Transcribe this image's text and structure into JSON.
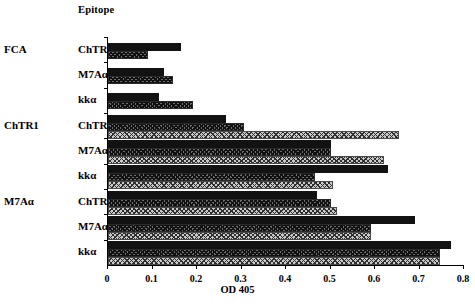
{
  "header": {
    "epitope_column_title": "Epitope"
  },
  "axis": {
    "x_title": "OD 405",
    "x_ticks": [
      "0",
      "0.1",
      "0.2",
      "0.3",
      "0.4",
      "0.5",
      "0.6",
      "0.7",
      "0.8"
    ]
  },
  "groups": [
    {
      "immunogen": "FCA",
      "rows": [
        {
          "epitope": "ChTR1",
          "values": [
            0.165,
            0.09
          ]
        },
        {
          "epitope": "M7Aα",
          "values": [
            0.125,
            0.145
          ]
        },
        {
          "epitope": "kkα",
          "values": [
            0.115,
            0.19
          ]
        }
      ]
    },
    {
      "immunogen": "ChTR1",
      "rows": [
        {
          "epitope": "ChTR1",
          "values": [
            0.265,
            0.305,
            0.655
          ]
        },
        {
          "epitope": "M7Aα",
          "values": [
            0.5,
            0.5,
            0.62
          ]
        },
        {
          "epitope": "kkα",
          "values": [
            0.63,
            0.465,
            0.505
          ]
        }
      ]
    },
    {
      "immunogen": "M7Aα",
      "rows": [
        {
          "epitope": "ChTR1",
          "values": [
            0.47,
            0.5,
            0.515
          ]
        },
        {
          "epitope": "M7Aα",
          "values": [
            0.69,
            0.59,
            0.59
          ]
        },
        {
          "epitope": "kkα",
          "values": [
            0.77,
            0.745,
            0.745
          ]
        }
      ]
    }
  ],
  "chart_data": {
    "type": "bar",
    "orientation": "horizontal",
    "title": "",
    "xlabel": "OD 405",
    "ylabel": "Epitope",
    "xlim": [
      0,
      0.8
    ],
    "xticks": [
      0,
      0.1,
      0.2,
      0.3,
      0.4,
      0.5,
      0.6,
      0.7,
      0.8
    ],
    "grid": false,
    "legend": "none",
    "group_field": "immunization group",
    "categories": [
      "FCA / ChTR1",
      "FCA / M7Aα",
      "FCA / kkα",
      "ChTR1 / ChTR1",
      "ChTR1 / M7Aα",
      "ChTR1 / kkα",
      "M7Aα / ChTR1",
      "M7Aα / M7Aα",
      "M7Aα / kkα"
    ],
    "series": [
      {
        "name": "solid-black",
        "pattern": "solid black",
        "values": [
          0.165,
          0.125,
          0.115,
          0.265,
          0.5,
          0.63,
          0.47,
          0.69,
          0.77
        ]
      },
      {
        "name": "dark-hatch",
        "pattern": "dark checkerboard",
        "values": [
          0.09,
          0.145,
          0.19,
          0.305,
          0.5,
          0.465,
          0.5,
          0.59,
          0.745
        ]
      },
      {
        "name": "light-hatch",
        "pattern": "light checkerboard",
        "values": [
          null,
          null,
          null,
          0.655,
          0.62,
          0.505,
          0.515,
          0.59,
          0.745
        ]
      }
    ]
  }
}
